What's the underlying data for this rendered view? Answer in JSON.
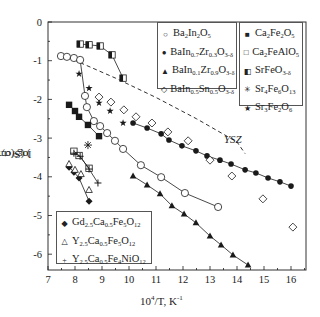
{
  "chart_data": {
    "type": "scatter",
    "title": "",
    "xlabel": "10^4/T, K^-1",
    "ylabel": "log (σ, σO) (S/cm)",
    "xlim": [
      7,
      16.5
    ],
    "ylim": [
      -6.4,
      0
    ],
    "xticks": [
      7,
      8,
      9,
      10,
      11,
      12,
      13,
      14,
      15,
      16
    ],
    "yticks": [
      0,
      -1,
      -2,
      -3,
      -4,
      -5,
      -6
    ],
    "grid": false,
    "annotations": [
      {
        "text": "YSZ",
        "x": 13.5,
        "y": -3.05
      }
    ],
    "reference_lines": [
      {
        "name": "YSZ",
        "style": "dashed",
        "x": [
          7.96,
          9.5,
          11.0,
          12.5,
          14.0,
          14.3
        ],
        "y": [
          -0.98,
          -1.45,
          -1.95,
          -2.5,
          -3.1,
          -3.4
        ]
      }
    ],
    "series": [
      {
        "name": "Ba2In2O5",
        "marker": "open-circle",
        "line": true,
        "x": [
          7.48,
          7.7,
          7.96,
          8.19,
          8.37,
          8.44,
          8.7,
          8.93,
          9.19,
          9.48,
          9.78,
          10.44,
          11.19,
          12.07,
          13.3
        ],
        "y": [
          -0.88,
          -0.9,
          -0.93,
          -0.98,
          -1.91,
          -2.2,
          -2.56,
          -2.69,
          -2.87,
          -3.07,
          -3.28,
          -3.7,
          -4.01,
          -4.42,
          -4.78
        ]
      },
      {
        "name": "BaIn0.7Zr0.3O3-δ",
        "marker": "filled-circle",
        "line": true,
        "x": [
          10.15,
          10.67,
          11.19,
          11.48,
          11.96,
          12.48,
          12.89,
          13.37,
          13.78,
          14.3,
          14.7,
          15.15,
          15.59,
          16.0
        ],
        "y": [
          -2.61,
          -2.74,
          -2.89,
          -3.05,
          -3.2,
          -3.33,
          -3.46,
          -3.57,
          -3.67,
          -3.82,
          -3.9,
          -4.03,
          -4.13,
          -4.24
        ]
      },
      {
        "name": "BaIn0.1Zr0.9O3-δ",
        "marker": "filled-triangle",
        "line": true,
        "x": [
          10.15,
          10.67,
          11.15,
          11.59,
          12.04,
          12.48,
          13.0,
          13.41,
          13.85,
          14.41
        ],
        "y": [
          -3.98,
          -4.21,
          -4.44,
          -4.75,
          -4.96,
          -5.19,
          -5.53,
          -5.76,
          -6.02,
          -6.28
        ]
      },
      {
        "name": "BaIn0.5Sn0.5O3-δ",
        "marker": "open-diamond",
        "line": false,
        "x": [
          8.89,
          9.33,
          9.81,
          10.26,
          10.85,
          11.44,
          12.19,
          13.0,
          13.81,
          14.96,
          16.07
        ],
        "y": [
          -1.94,
          -2.07,
          -2.27,
          -2.45,
          -2.61,
          -2.84,
          -3.07,
          -3.57,
          -3.98,
          -4.57,
          -5.3
        ]
      },
      {
        "name": "Ca2Fe2O5",
        "marker": "filled-square",
        "line": true,
        "x": [
          7.78,
          8.0,
          8.15,
          8.48,
          8.89
        ],
        "y": [
          -2.14,
          -2.3,
          -2.45,
          -2.66,
          -2.95
        ]
      },
      {
        "name": "Ca2FeAlO5",
        "marker": "open-square",
        "line": true,
        "x": [
          7.96,
          8.15,
          8.52
        ],
        "y": [
          -3.34,
          -3.45,
          -3.78
        ]
      },
      {
        "name": "SrFeO3-δ",
        "marker": "half-square",
        "line": true,
        "x": [
          8.19,
          8.52,
          8.93,
          9.37,
          9.78
        ],
        "y": [
          -0.57,
          -0.59,
          -0.62,
          -0.85,
          -1.45
        ]
      },
      {
        "name": "Sr4Fe6O13",
        "marker": "asterisk",
        "line": false,
        "x": [
          8.48
        ],
        "y": [
          -3.18
        ]
      },
      {
        "name": "Sr3Fe2O6",
        "marker": "star",
        "line": false,
        "x": [
          8.15,
          8.52,
          8.89,
          9.3,
          9.78
        ],
        "y": [
          -1.34,
          -1.71,
          -2.09,
          -2.3,
          -2.61
        ]
      },
      {
        "name": "Gd2.5Ca0.5Fe5O12",
        "marker": "filled-diamond",
        "line": true,
        "x": [
          7.78,
          7.96,
          8.15,
          8.52
        ],
        "y": [
          -3.75,
          -3.88,
          -4.03,
          -4.63
        ]
      },
      {
        "name": "Y2.5Ca0.5Fe5O12",
        "marker": "open-triangle",
        "line": false,
        "x": [
          7.78,
          8.0,
          8.22,
          8.52
        ],
        "y": [
          -3.67,
          -3.82,
          -3.93,
          -4.34
        ]
      },
      {
        "name": "Y2.5Ca0.5Fe4NiO12",
        "marker": "plus",
        "line": true,
        "x": [
          7.96,
          8.19,
          8.52,
          8.85
        ],
        "y": [
          -3.39,
          -3.47,
          -3.8,
          -4.16
        ]
      }
    ]
  },
  "legend": {
    "box1": [
      {
        "sym": "○",
        "parts": [
          [
            "Ba",
            ""
          ],
          [
            "2",
            "sub"
          ],
          [
            "In",
            ""
          ],
          [
            "2",
            "sub"
          ],
          [
            "O",
            ""
          ],
          [
            "5",
            "sub"
          ]
        ]
      },
      {
        "sym": "●",
        "parts": [
          [
            "BaIn",
            ""
          ],
          [
            "0.7",
            "sub"
          ],
          [
            "Zr",
            ""
          ],
          [
            "0.3",
            "sub"
          ],
          [
            "O",
            ""
          ],
          [
            "3-δ",
            "sub"
          ]
        ]
      },
      {
        "sym": "▲",
        "parts": [
          [
            "BaIn",
            ""
          ],
          [
            "0.1",
            "sub"
          ],
          [
            "Zr",
            ""
          ],
          [
            "0.9",
            "sub"
          ],
          [
            "O",
            ""
          ],
          [
            "3-δ",
            "sub"
          ]
        ]
      },
      {
        "sym": "◇",
        "parts": [
          [
            "BaIn",
            ""
          ],
          [
            "0.5",
            "sub"
          ],
          [
            "Sn",
            ""
          ],
          [
            "0.5",
            "sub"
          ],
          [
            "O",
            ""
          ],
          [
            "3-δ",
            "sub"
          ]
        ]
      }
    ],
    "box2": [
      {
        "sym": "■",
        "parts": [
          [
            "Ca",
            ""
          ],
          [
            "2",
            "sub"
          ],
          [
            "Fe",
            ""
          ],
          [
            "2",
            "sub"
          ],
          [
            "O",
            ""
          ],
          [
            "5",
            "sub"
          ]
        ]
      },
      {
        "sym": "□",
        "parts": [
          [
            "Ca",
            ""
          ],
          [
            "2",
            "sub"
          ],
          [
            "FeAlO",
            ""
          ],
          [
            "5",
            "sub"
          ]
        ]
      },
      {
        "sym": "◧",
        "parts": [
          [
            "SrFeO",
            ""
          ],
          [
            "3-δ",
            "sub"
          ]
        ]
      },
      {
        "sym": "✳",
        "parts": [
          [
            "Sr",
            ""
          ],
          [
            "4",
            "sub"
          ],
          [
            "Fe",
            ""
          ],
          [
            "6",
            "sub"
          ],
          [
            "O",
            ""
          ],
          [
            "13",
            "sub"
          ]
        ]
      },
      {
        "sym": "★",
        "parts": [
          [
            "Sr",
            ""
          ],
          [
            "3",
            "sub"
          ],
          [
            "Fe",
            ""
          ],
          [
            "2",
            "sub"
          ],
          [
            "O",
            ""
          ],
          [
            "6",
            "sub"
          ]
        ]
      }
    ],
    "box3": [
      {
        "sym": "◆",
        "parts": [
          [
            "Gd",
            ""
          ],
          [
            "2.5",
            "sub"
          ],
          [
            "Ca",
            ""
          ],
          [
            "0.5",
            "sub"
          ],
          [
            "Fe",
            ""
          ],
          [
            "5",
            "sub"
          ],
          [
            "O",
            ""
          ],
          [
            "12",
            "sub"
          ]
        ]
      },
      {
        "sym": "△",
        "parts": [
          [
            "Y",
            ""
          ],
          [
            "2.5",
            "sub"
          ],
          [
            "Ca",
            ""
          ],
          [
            "0.5",
            "sub"
          ],
          [
            "Fe",
            ""
          ],
          [
            "5",
            "sub"
          ],
          [
            "O",
            ""
          ],
          [
            "12",
            "sub"
          ]
        ]
      },
      {
        "sym": "+",
        "parts": [
          [
            "Y",
            ""
          ],
          [
            "2.5",
            "sub"
          ],
          [
            "Ca",
            ""
          ],
          [
            "0.5",
            "sub"
          ],
          [
            "Fe",
            ""
          ],
          [
            "4",
            "sub"
          ],
          [
            "NiO",
            ""
          ],
          [
            "12",
            "sub"
          ]
        ]
      }
    ]
  },
  "labels": {
    "ylabel": "log (σ, σ",
    "ylabel_sub": "O",
    "ylabel_tail": ") (S/cm)",
    "xlabel_pre": "10",
    "xlabel_sup": "4",
    "xlabel_mid": "/T, K",
    "xlabel_sup2": "-1",
    "ysz": "YSZ"
  },
  "colors": {
    "ink": "#1a1a1a",
    "frame": "#333333",
    "legend_border": "#555555"
  }
}
